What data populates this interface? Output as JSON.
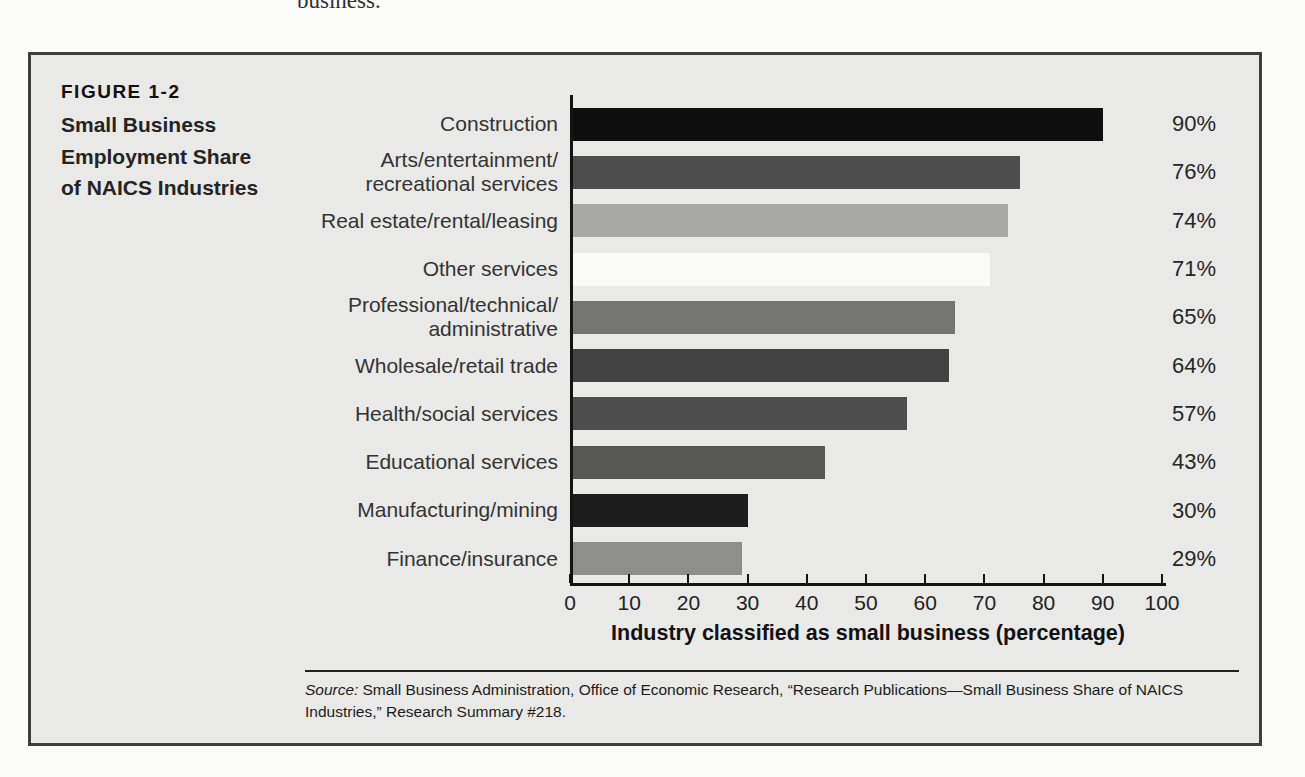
{
  "page": {
    "cropped_text_top": "business.",
    "background": "#fcfcfa"
  },
  "figure": {
    "label": "FIGURE 1-2",
    "title": "Small Business Employment Share of NAICS Industries",
    "box_bg": "#e9e9e7",
    "box_border": "#3f3f3f"
  },
  "chart_data": {
    "type": "bar",
    "orientation": "horizontal",
    "categories": [
      "Construction",
      "Arts/entertainment/\nrecreational services",
      "Real estate/rental/leasing",
      "Other services",
      "Professional/technical/\nadministrative",
      "Wholesale/retail trade",
      "Health/social services",
      "Educational services",
      "Manufacturing/mining",
      "Finance/insurance"
    ],
    "values": [
      90,
      76,
      74,
      71,
      65,
      64,
      57,
      43,
      30,
      29
    ],
    "value_labels": [
      "90%",
      "76%",
      "74%",
      "71%",
      "65%",
      "64%",
      "57%",
      "43%",
      "30%",
      "29%"
    ],
    "bar_colors": [
      "#0f0f0f",
      "#4d4d4d",
      "#a8a8a6",
      "#fafaf8",
      "#747472",
      "#424242",
      "#4e4e4e",
      "#575755",
      "#1d1d1d",
      "#8e8e8c"
    ],
    "xlabel": "Industry classified as small business (percentage)",
    "xlim": [
      0,
      100
    ],
    "xticks": [
      0,
      10,
      20,
      30,
      40,
      50,
      60,
      70,
      80,
      90,
      100
    ],
    "grid": false,
    "legend": "none",
    "axis_color": "#141414"
  },
  "source": {
    "label": "Source:",
    "text": "Small Business Administration, Office of Economic Research, “Research Publications—Small Business Share of NAICS Industries,” Research Summary #218."
  }
}
